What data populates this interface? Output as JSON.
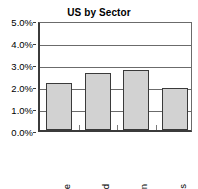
{
  "chart_data": {
    "type": "bar",
    "title": "US by Sector",
    "xlabel": "",
    "ylabel": "",
    "categories": [
      "Textile",
      "Food",
      "Engin",
      "Stores"
    ],
    "values": [
      2.15,
      2.6,
      2.75,
      1.9
    ],
    "value_unit": "%",
    "ylim": [
      0.0,
      5.0
    ],
    "ytick_values": [
      0.0,
      1.0,
      2.0,
      3.0,
      4.0,
      5.0
    ],
    "ytick_labels": [
      "0.0%",
      "1.0%",
      "2.0%",
      "3.0%",
      "4.0%",
      "5.0%"
    ],
    "grid": true,
    "legend": false,
    "legend_position": "none",
    "series": [
      {
        "name": "US by Sector",
        "values": [
          2.15,
          2.6,
          2.75,
          1.9
        ]
      }
    ],
    "colors": {
      "bar_fill": "#d2d2d2",
      "bar_border": "#3a3a3a",
      "gridline": "#6b6b6b",
      "axis": "#3b3b3b",
      "text": "#000000",
      "background": "#ffffff"
    }
  }
}
